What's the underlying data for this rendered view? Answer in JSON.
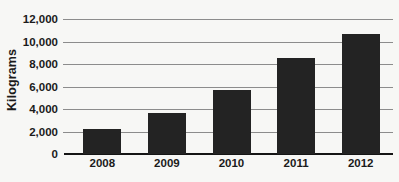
{
  "chart_data": {
    "type": "bar",
    "title": "",
    "xlabel": "",
    "ylabel": "Kilograms",
    "categories": [
      "2008",
      "2009",
      "2010",
      "2011",
      "2012"
    ],
    "values": [
      2250,
      3650,
      5700,
      8500,
      10700
    ],
    "series": [
      {
        "name": "Kilograms",
        "values": [
          2250,
          3650,
          5700,
          8500,
          10700
        ]
      }
    ],
    "ylim": [
      0,
      12000
    ],
    "ytick_values": [
      0,
      2000,
      4000,
      6000,
      8000,
      10000,
      12000
    ],
    "ytick_labels": [
      "0",
      "2,000",
      "4,000",
      "6,000",
      "8,000",
      "10,000",
      "12,000"
    ],
    "grid": true,
    "grid_axis": "y",
    "legend": false,
    "legend_position": "none",
    "bar_color": "#232323",
    "gridline_color": "#8c8c8c",
    "axis_color": "#151515",
    "background_color": "#f7f7f5",
    "text_color": "#1b1b1b"
  }
}
